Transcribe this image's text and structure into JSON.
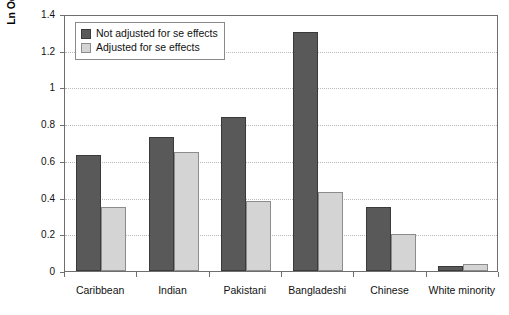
{
  "chart_data": {
    "type": "bar",
    "title": "",
    "xlabel": "",
    "ylabel": "Ln Odds ratio compared with White English",
    "categories": [
      "Caribbean",
      "Indian",
      "Pakistani",
      "Bangladeshi",
      "Chinese",
      "White minority"
    ],
    "series": [
      {
        "name": "Not adjusted for se effects",
        "color": "#595959",
        "values": [
          0.63,
          0.73,
          0.84,
          1.3,
          0.35,
          0.025
        ]
      },
      {
        "name": "Adjusted for se effects",
        "color": "#d4d4d4",
        "values": [
          0.35,
          0.65,
          0.38,
          0.43,
          0.2,
          0.04
        ]
      }
    ],
    "ylim": [
      0,
      1.4
    ],
    "yticks": [
      "0",
      "0.2",
      "0.4",
      "0.6",
      "0.8",
      "1",
      "1.2",
      "1.4"
    ],
    "ytick_values": [
      0,
      0.2,
      0.4,
      0.6,
      0.8,
      1.0,
      1.2,
      1.4
    ],
    "grid": true,
    "legend_position": "top-left"
  },
  "legend": {
    "items": [
      {
        "label": "Not adjusted for se effects",
        "swatch": "dark-gray-swatch"
      },
      {
        "label": "Adjusted for se effects",
        "swatch": "light-gray-swatch"
      }
    ]
  }
}
